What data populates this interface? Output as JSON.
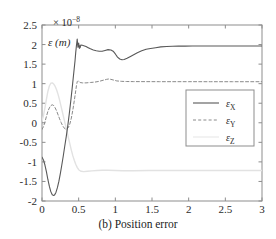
{
  "figure": {
    "caption": "(b) Position error",
    "y_axis_label": "ε (m)",
    "y_axis_exponent_prefix": "× 10",
    "y_axis_exponent_power": "−8",
    "background_color": "#ffffff",
    "axis_color": "#8d8d8d",
    "text_color": "#2b2b2b"
  },
  "chart_data": {
    "type": "line",
    "title": "(b) Position error",
    "xlabel": "",
    "ylabel": "ε (m)",
    "y_exponent": -8,
    "xlim": [
      0,
      3
    ],
    "ylim": [
      -2,
      2.5
    ],
    "xticks": [
      0,
      0.5,
      1,
      1.5,
      2,
      2.5,
      3
    ],
    "xticklabels": [
      "0",
      "0.5",
      "1",
      "1.5",
      "2",
      "2.5",
      "3"
    ],
    "yticks": [
      -2,
      -1.5,
      -1,
      -0.5,
      0,
      0.5,
      1,
      1.5,
      2,
      2.5
    ],
    "yticklabels": [
      "-2",
      "-1.5",
      "-1",
      "-0.5",
      "0",
      "0.5",
      "1",
      "1.5",
      "2",
      "2.5"
    ],
    "grid": false,
    "box": true,
    "legend_position": "center-right",
    "series": [
      {
        "name": "εX",
        "label_base": "ε",
        "label_sub": "X",
        "style": "solid",
        "color": "#585858",
        "width": 1.1,
        "x": [
          0.0,
          0.02,
          0.04,
          0.06,
          0.08,
          0.1,
          0.12,
          0.14,
          0.16,
          0.17,
          0.19,
          0.21,
          0.23,
          0.25,
          0.27,
          0.29,
          0.31,
          0.33,
          0.35,
          0.37,
          0.39,
          0.41,
          0.43,
          0.45,
          0.46,
          0.47,
          0.475,
          0.48,
          0.49,
          0.5,
          0.51,
          0.515,
          0.52,
          0.53,
          0.55,
          0.57,
          0.6,
          0.63,
          0.66,
          0.7,
          0.74,
          0.78,
          0.82,
          0.86,
          0.9,
          0.94,
          0.97,
          1.0,
          1.03,
          1.06,
          1.09,
          1.12,
          1.16,
          1.2,
          1.25,
          1.3,
          1.36,
          1.42,
          1.48,
          1.55,
          1.62,
          1.7,
          1.78,
          1.86,
          1.95,
          2.05,
          2.2,
          2.4,
          2.6,
          2.8,
          3.0
        ],
        "y": [
          -0.88,
          -0.95,
          -1.08,
          -1.25,
          -1.45,
          -1.62,
          -1.76,
          -1.84,
          -1.86,
          -1.85,
          -1.78,
          -1.66,
          -1.5,
          -1.3,
          -1.08,
          -0.85,
          -0.6,
          -0.36,
          -0.1,
          0.2,
          0.52,
          0.86,
          1.22,
          1.58,
          1.8,
          1.98,
          2.06,
          2.14,
          1.93,
          2.04,
          1.9,
          1.97,
          1.92,
          1.99,
          1.98,
          1.97,
          1.95,
          1.92,
          1.89,
          1.86,
          1.84,
          1.83,
          1.83,
          1.85,
          1.87,
          1.86,
          1.83,
          1.76,
          1.68,
          1.63,
          1.61,
          1.62,
          1.65,
          1.69,
          1.74,
          1.79,
          1.84,
          1.88,
          1.9,
          1.92,
          1.94,
          1.95,
          1.955,
          1.96,
          1.96,
          1.962,
          1.963,
          1.963,
          1.963,
          1.963,
          1.963
        ]
      },
      {
        "name": "εY",
        "label_base": "ε",
        "label_sub": "Y",
        "style": "dashed",
        "color": "#8a8a8a",
        "width": 1.0,
        "x": [
          0.0,
          0.02,
          0.04,
          0.06,
          0.08,
          0.1,
          0.12,
          0.14,
          0.16,
          0.18,
          0.2,
          0.22,
          0.24,
          0.26,
          0.28,
          0.3,
          0.32,
          0.34,
          0.36,
          0.38,
          0.4,
          0.42,
          0.44,
          0.46,
          0.47,
          0.48,
          0.49,
          0.5,
          0.52,
          0.55,
          0.6,
          0.66,
          0.72,
          0.78,
          0.84,
          0.88,
          0.91,
          0.94,
          0.98,
          1.02,
          1.08,
          1.15,
          1.25,
          1.4,
          1.6,
          1.8,
          2.0,
          2.3,
          2.6,
          3.0
        ],
        "y": [
          -0.17,
          -0.1,
          0.02,
          0.16,
          0.29,
          0.38,
          0.44,
          0.46,
          0.44,
          0.38,
          0.3,
          0.2,
          0.1,
          0.01,
          -0.07,
          -0.13,
          -0.16,
          -0.16,
          -0.12,
          -0.03,
          0.12,
          0.32,
          0.56,
          0.82,
          0.95,
          1.05,
          1.07,
          1.06,
          1.03,
          1.02,
          1.02,
          1.03,
          1.04,
          1.06,
          1.09,
          1.11,
          1.12,
          1.11,
          1.09,
          1.07,
          1.06,
          1.055,
          1.053,
          1.052,
          1.051,
          1.051,
          1.051,
          1.05,
          1.05,
          1.05
        ]
      },
      {
        "name": "εZ",
        "label_base": "ε",
        "label_sub": "Z",
        "style": "solid",
        "color": "#e2e2e2",
        "width": 1.4,
        "x": [
          0.0,
          0.02,
          0.04,
          0.06,
          0.08,
          0.1,
          0.12,
          0.14,
          0.16,
          0.18,
          0.2,
          0.22,
          0.24,
          0.26,
          0.28,
          0.3,
          0.32,
          0.34,
          0.36,
          0.38,
          0.4,
          0.42,
          0.44,
          0.46,
          0.48,
          0.5,
          0.53,
          0.57,
          0.62,
          0.68,
          0.75,
          0.82,
          0.9,
          1.0,
          1.1,
          1.25,
          1.45,
          1.7,
          2.0,
          2.4,
          3.0
        ],
        "y": [
          0.05,
          0.18,
          0.38,
          0.6,
          0.8,
          0.94,
          1.01,
          1.02,
          0.99,
          0.93,
          0.84,
          0.72,
          0.58,
          0.42,
          0.26,
          0.1,
          -0.06,
          -0.22,
          -0.38,
          -0.54,
          -0.7,
          -0.84,
          -0.96,
          -1.06,
          -1.14,
          -1.2,
          -1.24,
          -1.25,
          -1.24,
          -1.23,
          -1.22,
          -1.215,
          -1.215,
          -1.22,
          -1.225,
          -1.225,
          -1.222,
          -1.22,
          -1.22,
          -1.22,
          -1.22
        ]
      }
    ]
  },
  "legend": {
    "entries": [
      {
        "label_base": "ε",
        "label_sub": "X",
        "style": "solid",
        "color": "#585858"
      },
      {
        "label_base": "ε",
        "label_sub": "Y",
        "style": "dashed",
        "color": "#8a8a8a"
      },
      {
        "label_base": "ε",
        "label_sub": "Z",
        "style": "solid",
        "color": "#e8e8e8"
      }
    ]
  }
}
